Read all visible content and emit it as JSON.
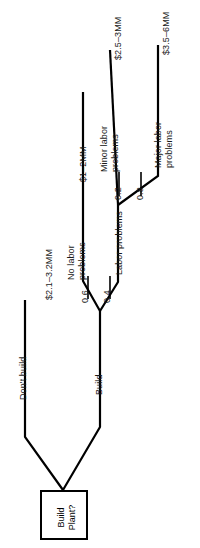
{
  "diagram": {
    "root": {
      "name": "Build Plant?",
      "label_line1": "Build",
      "label_line2": "Plant?",
      "type": "decision-node"
    },
    "branches": {
      "dont_build": {
        "label": "Don't build",
        "payoff": "$2.1–3.2MM"
      },
      "build": {
        "label": "Build"
      },
      "no_labor_problems": {
        "label_line1": "No labor",
        "label_line2": "problems",
        "probability": "0.6",
        "payoff": "$1–2MM"
      },
      "labor_problems": {
        "label": "Labor problems",
        "probability": "0.4"
      },
      "minor_labor_problems": {
        "label_line1": "Minor labor",
        "label_line2": "problems",
        "probability": "0.2",
        "payoff": "$2.5–3MM"
      },
      "major_labor_problems": {
        "label_line1": "Major labor",
        "label_line2": "problems",
        "probability": "0.8",
        "payoff": "$3.5–6MM"
      }
    },
    "colors": {
      "line": "#000000",
      "text": "#1a1a1a",
      "background": "#ffffff"
    }
  }
}
